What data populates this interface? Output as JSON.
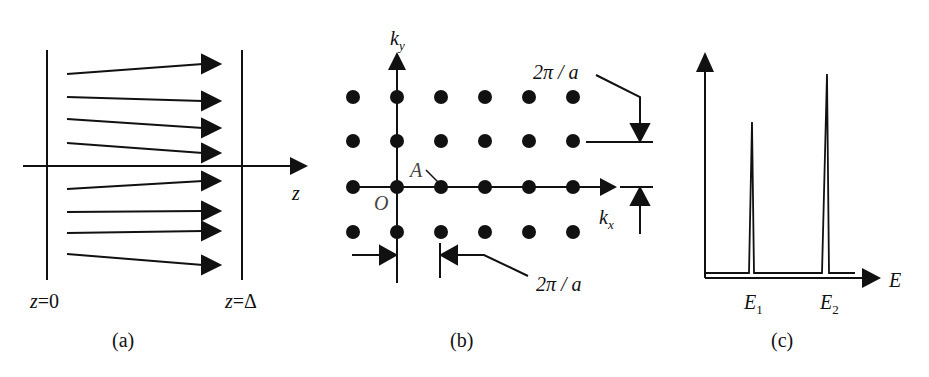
{
  "figure": {
    "panels": [
      {
        "id": "a",
        "caption": "(a)",
        "left_boundary_label": "z=0",
        "right_boundary_label": "z=Δ",
        "axis_label": "z",
        "arrow_count": 8
      },
      {
        "id": "b",
        "caption": "(b)",
        "ky_label": "k",
        "ky_sub": "y",
        "kx_label": "k",
        "kx_sub": "x",
        "origin_label": "O",
        "point_label": "A",
        "vertical_spacing_label": "2π / a",
        "horizontal_spacing_label": "2π / a",
        "lattice": {
          "columns": 6,
          "rows": 4
        }
      },
      {
        "id": "c",
        "caption": "(c)",
        "axis_label": "E",
        "peaks": [
          {
            "label": "E",
            "sub": "1"
          },
          {
            "label": "E",
            "sub": "2"
          }
        ]
      }
    ]
  },
  "colors": {
    "ink": "#111111",
    "background": "#ffffff"
  }
}
